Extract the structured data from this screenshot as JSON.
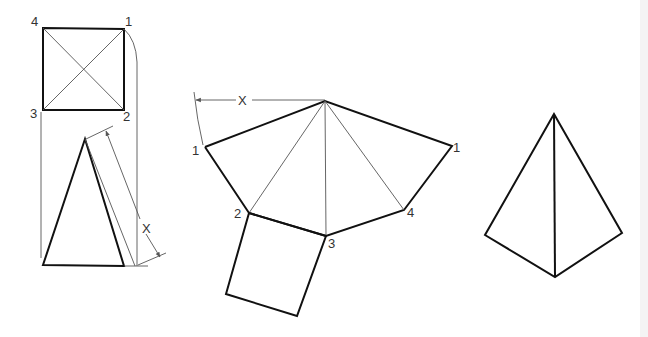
{
  "diagram": {
    "title": "",
    "colors": {
      "line": "#111111",
      "construction": "#555555",
      "label": "#333333",
      "background": "#ffffff"
    },
    "top_view": {
      "labels": {
        "p1": "1",
        "p2": "2",
        "p3": "3",
        "p4": "4"
      }
    },
    "front_view": {
      "dimension_label": "X"
    },
    "development": {
      "radius_label": "X",
      "labels": {
        "p1_left": "1",
        "p2": "2",
        "p3": "3",
        "p4": "4",
        "p1_right": "1"
      }
    },
    "pictorial": {
      "labels": {}
    }
  }
}
